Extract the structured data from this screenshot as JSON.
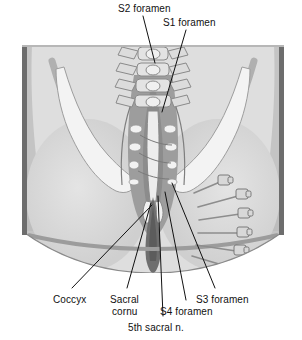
{
  "figure": {
    "name": "sacral-foramina-nerve-block-illustration",
    "view": "posterior view of sacrum and gluteal region with needles in sacral foramina",
    "frame": {
      "left": 22,
      "top": 45,
      "width": 262,
      "height": 228
    },
    "colors": {
      "border": "#555555",
      "background_light": "#e7e7e7",
      "skin_light": "#dcdcdc",
      "skin_mid": "#c9c9c9",
      "skin_dark": "#a8a8a8",
      "muscle_dark": "#8f8f8f",
      "bone_light": "#f2f2f2",
      "bone_shadow": "#bdbdbd",
      "cleft_dark": "#6f6f6f",
      "outline": "#6a6a6a",
      "needle": "#9a9a9a",
      "leader_line": "#111111",
      "text": "#111111"
    }
  },
  "labels": {
    "top": [
      {
        "id": "s2-foramen",
        "text": "S2 foramen",
        "x": 118,
        "y": 3
      },
      {
        "id": "s1-foramen",
        "text": "S1 foramen",
        "x": 163,
        "y": 17
      }
    ],
    "bottom": [
      {
        "id": "coccyx",
        "text": "Coccyx",
        "x": 53,
        "y": 294
      },
      {
        "id": "sacral-cornu-line1",
        "text": "Sacral",
        "x": 110,
        "y": 294
      },
      {
        "id": "sacral-cornu-line2",
        "text": "cornu",
        "x": 112,
        "y": 306
      },
      {
        "id": "s3-foramen",
        "text": "S3 foramen",
        "x": 196,
        "y": 294
      },
      {
        "id": "s4-foramen",
        "text": "S4 foramen",
        "x": 160,
        "y": 306
      },
      {
        "id": "fifth-sacral-nerve",
        "text": "5th sacral n.",
        "x": 128,
        "y": 322
      }
    ]
  },
  "leader_lines": [
    {
      "id": "leader-s2-foramen",
      "x1": 143,
      "y1": 16,
      "x2": 155,
      "y2": 63
    },
    {
      "id": "leader-s1-foramen",
      "x1": 186,
      "y1": 30,
      "x2": 162,
      "y2": 112
    },
    {
      "id": "leader-coccyx",
      "x1": 72,
      "y1": 288,
      "x2": 152,
      "y2": 205
    },
    {
      "id": "leader-sacral-cornu",
      "x1": 127,
      "y1": 288,
      "x2": 151,
      "y2": 203
    },
    {
      "id": "leader-fifth-sacral-nerve",
      "x1": 163,
      "y1": 316,
      "x2": 158,
      "y2": 196
    },
    {
      "id": "leader-s4-foramen",
      "x1": 186,
      "y1": 300,
      "x2": 165,
      "y2": 192
    },
    {
      "id": "leader-s3-foramen",
      "x1": 215,
      "y1": 288,
      "x2": 172,
      "y2": 183
    }
  ],
  "needles": [
    {
      "id": "needle-1",
      "hub_x": 223,
      "hub_y": 150,
      "tip_x": 176,
      "tip_y": 162
    },
    {
      "id": "needle-2",
      "hub_x": 225,
      "hub_y": 168,
      "tip_x": 177,
      "tip_y": 175
    },
    {
      "id": "needle-3",
      "hub_x": 224,
      "hub_y": 187,
      "tip_x": 176,
      "tip_y": 188
    },
    {
      "id": "needle-4",
      "hub_x": 221,
      "hub_y": 205,
      "tip_x": 174,
      "tip_y": 200
    },
    {
      "id": "needle-5",
      "hub_x": 214,
      "hub_y": 222,
      "tip_x": 170,
      "tip_y": 211
    },
    {
      "id": "needle-6",
      "hub_x": 203,
      "hub_y": 135,
      "tip_x": 172,
      "tip_y": 148
    }
  ]
}
